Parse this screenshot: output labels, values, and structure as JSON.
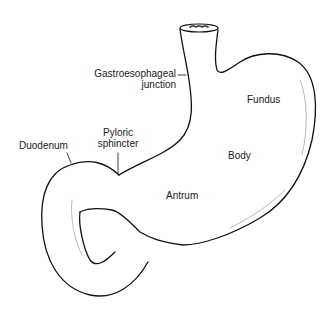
{
  "figure": {
    "labels": {
      "ge_junction_line1": "Gastroesophageal",
      "ge_junction_line2": "junction",
      "fundus": "Fundus",
      "body": "Body",
      "antrum": "Antrum",
      "pyloric_line1": "Pyloric",
      "pyloric_line2": "sphincter",
      "duodenum": "Duodenum"
    },
    "colors": {
      "line": "#111111",
      "background": "#ffffff",
      "text": "#1a1a1a"
    }
  }
}
